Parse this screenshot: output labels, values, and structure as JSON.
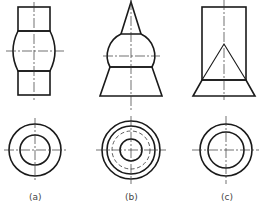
{
  "figure": {
    "type": "orthographic projections (front view + top view) of three combined solids of revolution",
    "views": [
      {
        "id": "a",
        "label": "(a)",
        "description": "cylinder – sphere-segment barrel – cylinder; top view two concentric circles"
      },
      {
        "id": "b",
        "label": "(b)",
        "description": "cone on sphere on truncated cone; top view three solid circles and one hidden (dashed) circle"
      },
      {
        "id": "c",
        "label": "(c)",
        "description": "cylinder with internal cone, on truncated cone base; top view two concentric circles"
      }
    ],
    "colors": {
      "line": "#1a1a1a",
      "background": "#ffffff"
    }
  }
}
